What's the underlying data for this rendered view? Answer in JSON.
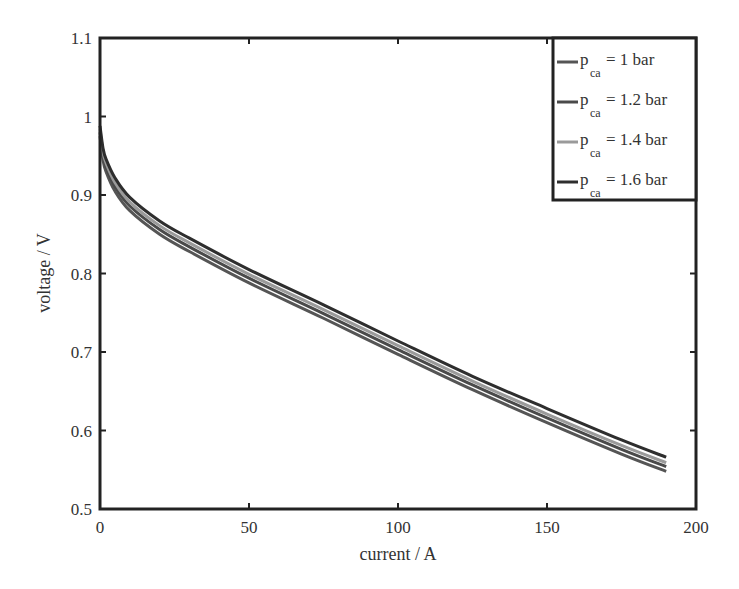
{
  "chart_data": {
    "type": "line",
    "title": "",
    "xlabel": "current / A",
    "ylabel": "voltage / V",
    "xlim": [
      0,
      200
    ],
    "ylim": [
      0.5,
      1.1
    ],
    "xticks": [
      0,
      50,
      100,
      150,
      200
    ],
    "yticks": [
      0.5,
      0.6,
      0.7,
      0.8,
      0.9,
      1,
      1.1
    ],
    "xtick_labels": [
      "0",
      "50",
      "100",
      "150",
      "200"
    ],
    "ytick_labels": [
      "0.5",
      "0.6",
      "0.7",
      "0.8",
      "0.9",
      "1",
      "1.1"
    ],
    "grid": false,
    "legend_position": "upper right",
    "x": [
      0,
      1,
      2,
      5,
      10,
      20,
      30,
      50,
      75,
      100,
      125,
      150,
      175,
      190
    ],
    "series": [
      {
        "name": "p_ca = 1 bar",
        "legend_main": "p",
        "legend_sub": "ca",
        "legend_rest": " = 1 bar",
        "color": "#555555",
        "values": [
          0.975,
          0.945,
          0.93,
          0.905,
          0.88,
          0.85,
          0.828,
          0.788,
          0.743,
          0.697,
          0.652,
          0.61,
          0.57,
          0.548
        ]
      },
      {
        "name": "p_ca = 1.2 bar",
        "legend_main": "p",
        "legend_sub": "ca",
        "legend_rest": " = 1.2 bar",
        "color": "#4a4a4a",
        "values": [
          0.98,
          0.95,
          0.936,
          0.911,
          0.886,
          0.856,
          0.834,
          0.794,
          0.749,
          0.703,
          0.658,
          0.616,
          0.576,
          0.554
        ]
      },
      {
        "name": "p_ca = 1.4 bar",
        "legend_main": "p",
        "legend_sub": "ca",
        "legend_rest": " = 1.4 bar",
        "color": "#9a9a9a",
        "values": [
          0.984,
          0.955,
          0.941,
          0.916,
          0.891,
          0.861,
          0.839,
          0.799,
          0.754,
          0.708,
          0.663,
          0.621,
          0.581,
          0.559
        ]
      },
      {
        "name": "p_ca = 1.6 bar",
        "legend_main": "p",
        "legend_sub": "ca",
        "legend_rest": " = 1.6 bar",
        "color": "#2e2e2e",
        "values": [
          0.988,
          0.96,
          0.946,
          0.922,
          0.897,
          0.867,
          0.845,
          0.805,
          0.76,
          0.714,
          0.669,
          0.628,
          0.588,
          0.566
        ]
      }
    ]
  }
}
